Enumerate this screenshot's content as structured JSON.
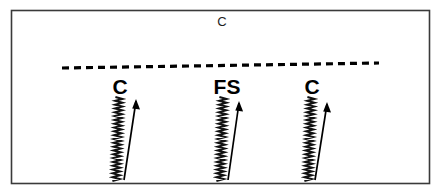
{
  "figure": {
    "name": "fault-scarp-schematic",
    "background_color": "#ffffff",
    "border_color": "#3a3a3a",
    "ink_color": "#000000"
  },
  "top_label": {
    "text": "c",
    "display_text": "C",
    "x": 222,
    "y": 26
  },
  "dashed_line": {
    "name": "dashed-datum-line",
    "x1": 62,
    "y1": 68,
    "x2": 379,
    "y2": 63,
    "dash_pattern": "7 5",
    "stroke_width": 3.2
  },
  "groups": [
    {
      "label": "C",
      "label_x": 120,
      "label_y": 94,
      "zigzag": {
        "x": 119,
        "top_y": 97,
        "bottom_y": 181,
        "amplitude": 3.6,
        "cycles": 22,
        "drift_x": -3
      },
      "arrow": {
        "tail_x": 124,
        "tail_y": 180,
        "tip_x": 136,
        "tip_y": 101
      }
    },
    {
      "label": "FS",
      "label_x": 227,
      "label_y": 94,
      "zigzag": {
        "x": 223,
        "top_y": 97,
        "bottom_y": 181,
        "amplitude": 3.6,
        "cycles": 22,
        "drift_x": -3
      },
      "arrow": {
        "tail_x": 228,
        "tail_y": 180,
        "tip_x": 239,
        "tip_y": 103
      }
    },
    {
      "label": "C",
      "label_x": 312,
      "label_y": 94,
      "zigzag": {
        "x": 311,
        "top_y": 97,
        "bottom_y": 181,
        "amplitude": 3.6,
        "cycles": 22,
        "drift_x": -3
      },
      "arrow": {
        "tail_x": 315,
        "tail_y": 180,
        "tip_x": 327,
        "tip_y": 104
      }
    }
  ],
  "panel": {
    "x": 11,
    "y": 10,
    "width": 419,
    "height": 174
  }
}
